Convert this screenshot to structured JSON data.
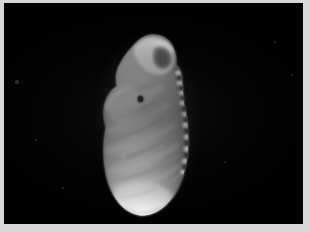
{
  "image": {
    "kind": "photomicrograph",
    "subject_label": "foraminifera-test-specimen",
    "view": "lateral / side view",
    "background_color": "#010101",
    "frame_color": "#d8d8d8",
    "specimen_color": "#f2f2f0",
    "shadow_color": "#6d6d6d",
    "pore_color": "#232323",
    "width_px": 310,
    "height_px": 232,
    "visible_text": ""
  },
  "frame": {
    "left_px": 4,
    "top_px": 3,
    "right_px": 7,
    "bottom_px": 8
  },
  "specimen": {
    "name": "calcareous microfossil test",
    "outline_bounds": {
      "x": 100,
      "y": 36,
      "width": 90,
      "height": 174
    },
    "orientation": "vertical, apex at top",
    "margin_left": "smooth lobate",
    "margin_right": "beaded serrated keel",
    "features": [
      {
        "name": "final-chamber",
        "note": "curved, hooked at apex"
      },
      {
        "name": "apertural-lip",
        "note": "raised rim at upper right"
      },
      {
        "name": "chamber-sutures",
        "count": 6,
        "note": "oblique, curved"
      },
      {
        "name": "surface-pore",
        "x": 140,
        "y": 99,
        "note": "single dark pit"
      },
      {
        "name": "keel-beads",
        "count": 9,
        "note": "bright nodes along right margin"
      }
    ]
  },
  "specks": [
    {
      "x": 17,
      "y": 82,
      "r": 1.6
    },
    {
      "x": 275,
      "y": 42,
      "r": 1.4
    },
    {
      "x": 292,
      "y": 75,
      "r": 1.1
    },
    {
      "x": 63,
      "y": 188,
      "r": 1.0
    },
    {
      "x": 225,
      "y": 162,
      "r": 0.9
    },
    {
      "x": 36,
      "y": 140,
      "r": 0.8
    }
  ]
}
